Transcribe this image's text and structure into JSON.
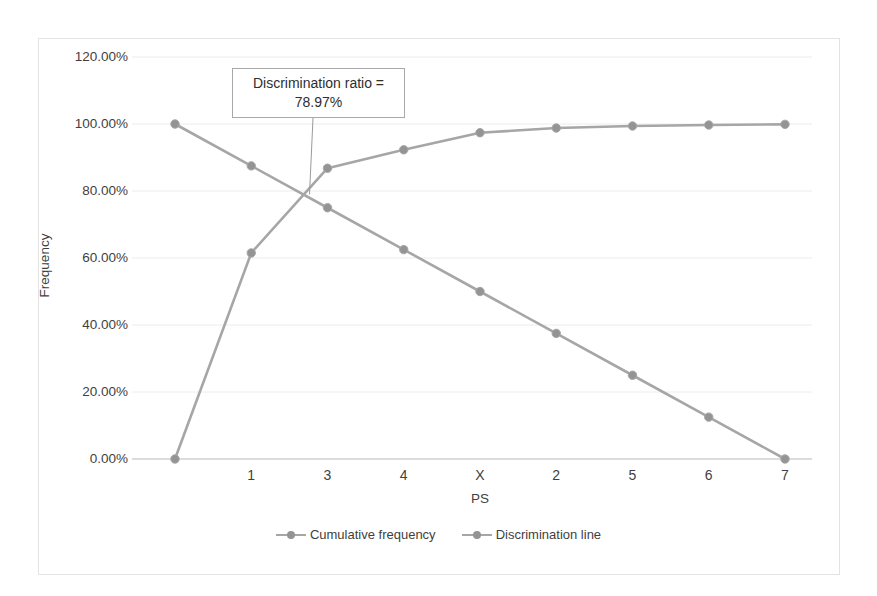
{
  "chart_data": {
    "type": "line",
    "title": "",
    "xlabel": "PS",
    "ylabel": "Frequency",
    "categories": [
      "",
      "1",
      "3",
      "4",
      "X",
      "2",
      "5",
      "6",
      "7"
    ],
    "ylim": [
      0,
      120
    ],
    "ytick_labels": [
      "120.00%",
      "100.00%",
      "80.00%",
      "60.00%",
      "40.00%",
      "20.00%",
      "0.00%"
    ],
    "ytick_values": [
      120,
      100,
      80,
      60,
      40,
      20,
      0
    ],
    "grid": true,
    "legend_position": "bottom-center",
    "series": [
      {
        "name": "Cumulative frequency",
        "color": "#a6a6a6",
        "values": [
          0.0,
          61.5,
          86.8,
          92.3,
          97.4,
          98.8,
          99.4,
          99.7,
          99.9
        ]
      },
      {
        "name": "Discrimination line",
        "color": "#a6a6a6",
        "values": [
          100.0,
          87.5,
          75.0,
          62.5,
          50.0,
          37.5,
          25.0,
          12.5,
          0.0
        ]
      }
    ],
    "annotations": [
      {
        "label_line1": "Discrimination ratio =",
        "label_line2": "78.97%",
        "value": 78.97,
        "target_category_index": 2
      }
    ]
  },
  "legend": {
    "items": [
      {
        "label": "Cumulative frequency"
      },
      {
        "label": "Discrimination line"
      }
    ]
  },
  "axes": {
    "y_title": "Frequency",
    "x_title": "PS"
  }
}
